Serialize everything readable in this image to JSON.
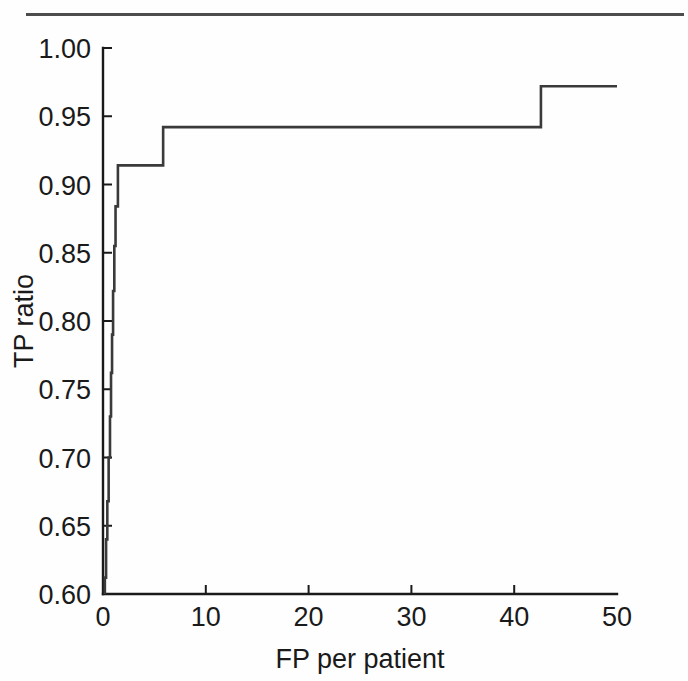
{
  "figure": {
    "rule_present": true,
    "background_color": "#fefefe",
    "line_color": "#3a3a3a",
    "axis_color": "#1a1a1a"
  },
  "chart_data": {
    "type": "line",
    "title": "",
    "subtitle": "",
    "xlabel": "FP per patient",
    "ylabel": "TP ratio",
    "xlim": [
      0,
      50
    ],
    "ylim": [
      0.6,
      1.0
    ],
    "xticks": [
      0,
      10,
      20,
      30,
      40,
      50
    ],
    "xticklabels": [
      "0",
      "10",
      "20",
      "30",
      "40",
      "50"
    ],
    "yticks": [
      0.6,
      0.65,
      0.7,
      0.75,
      0.8,
      0.85,
      0.9,
      0.95,
      1.0
    ],
    "yticklabels": [
      "0.60",
      "0.65",
      "0.70",
      "0.75",
      "0.80",
      "0.85",
      "0.90",
      "0.95",
      "1.00"
    ],
    "grid": false,
    "legend": null,
    "drawstyle": "steps-post",
    "series": [
      {
        "name": "FROC curve",
        "color": "#3a3a3a",
        "x": [
          0.18,
          0.18,
          0.3,
          0.3,
          0.42,
          0.42,
          0.55,
          0.55,
          0.68,
          0.68,
          0.78,
          0.78,
          0.88,
          0.88,
          0.98,
          0.98,
          1.1,
          1.1,
          1.22,
          1.22,
          1.45,
          1.45,
          5.85,
          5.85,
          42.6,
          42.6,
          50.0
        ],
        "y": [
          0.6,
          0.612,
          0.612,
          0.64,
          0.64,
          0.668,
          0.668,
          0.7,
          0.7,
          0.73,
          0.73,
          0.762,
          0.762,
          0.79,
          0.79,
          0.822,
          0.822,
          0.855,
          0.855,
          0.884,
          0.884,
          0.914,
          0.914,
          0.942,
          0.942,
          0.972,
          0.972
        ]
      }
    ],
    "annotations": [
      {
        "label": "plateau-1",
        "value": 0.914,
        "from_x": 1.45,
        "to_x": 5.85
      },
      {
        "label": "plateau-2",
        "value": 0.942,
        "from_x": 5.85,
        "to_x": 42.6
      },
      {
        "label": "plateau-3",
        "value": 0.972,
        "from_x": 42.6,
        "to_x": 50.0
      }
    ]
  }
}
